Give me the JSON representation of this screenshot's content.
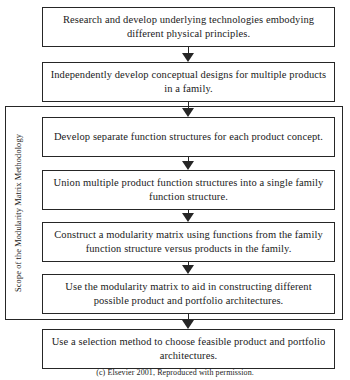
{
  "diagram": {
    "scope_label": "Scope of the Modularity Matrix Methodology",
    "nodes": [
      {
        "id": "n1",
        "text": "Research and develop underlying technologies embodying different physical principles."
      },
      {
        "id": "n2",
        "text": "Independently develop conceptual designs for multiple products in a family."
      },
      {
        "id": "n3",
        "text": "Develop separate function structures for each product concept."
      },
      {
        "id": "n4",
        "text": "Union multiple product function structures into a single family function structure."
      },
      {
        "id": "n5",
        "text": "Construct a modularity matrix using functions from the family function structure versus products in the family."
      },
      {
        "id": "n6",
        "text": "Use the modularity matrix to aid in constructing different possible product and portfolio architectures."
      },
      {
        "id": "n7",
        "text": "Use a selection method to choose feasible product and portfolio architectures."
      }
    ],
    "connectors": [
      {
        "from": "n1",
        "to": "n2",
        "kind": "arrow-down"
      },
      {
        "from": "n2",
        "to": "n3",
        "kind": "arrow-down"
      },
      {
        "from": "n3",
        "to": "n4",
        "kind": "arrow-down"
      },
      {
        "from": "n4",
        "to": "n5",
        "kind": "arrow-down"
      },
      {
        "from": "n5",
        "to": "n6",
        "kind": "arrow-down"
      },
      {
        "from": "n6",
        "to": "n7",
        "kind": "arrow-down"
      }
    ],
    "caption": "(c) Elsevier 2001, Reproduced with permission.",
    "colors": {
      "stroke": "#262626",
      "background": "#ffffff",
      "text": "#1a1a1a"
    }
  }
}
